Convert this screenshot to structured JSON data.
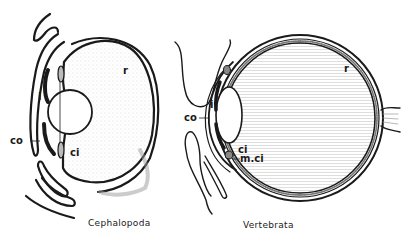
{
  "figure": {
    "panels": [
      {
        "caption": "Cephalopoda",
        "labels": {
          "r": "r",
          "i": "i",
          "co": "co",
          "ci": "ci"
        }
      },
      {
        "caption": "Vertebrata",
        "labels": {
          "r": "r",
          "i": "i",
          "co": "co",
          "ci": "ci",
          "mci": "m.ci"
        }
      }
    ],
    "colors": {
      "ink": "#1a1a1a",
      "background": "#ffffff",
      "shade": "#d8d8d8"
    }
  }
}
